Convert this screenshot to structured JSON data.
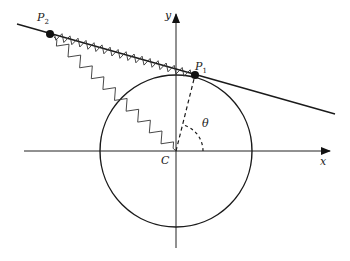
{
  "diagram": {
    "type": "geometry",
    "labels": {
      "x_axis": "x",
      "y_axis": "y",
      "center": "C",
      "angle": "θ",
      "point1": "P",
      "point1_sub": "1",
      "point2": "P",
      "point2_sub": "2"
    },
    "elements": [
      "coordinate axes with arrows",
      "circle centered at C",
      "tangent line through P1 and P2",
      "dashed radius from C to P1",
      "dashed angle arc theta",
      "spring from P2 to P1 along tangent",
      "spring from P2 to C"
    ],
    "colors": {
      "stroke": "#1a1a1a",
      "spring": "#333333",
      "background": "#ffffff"
    }
  }
}
